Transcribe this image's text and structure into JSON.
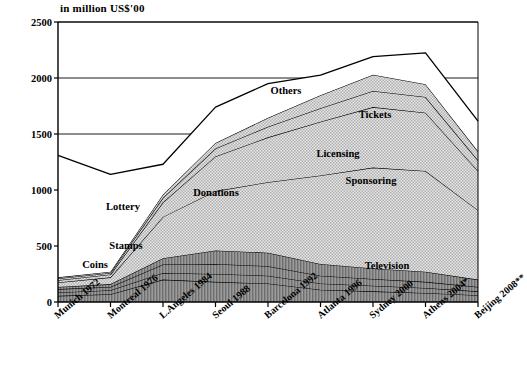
{
  "chart_data": {
    "type": "area",
    "title": "",
    "subtitle": "",
    "ylabel": "in million US$'00",
    "xlabel": "",
    "ylim": [
      0,
      2500
    ],
    "yticks": [
      0,
      500,
      1000,
      1500,
      2000,
      2500
    ],
    "grid": true,
    "legend_position": "inline-annotations",
    "stacked": true,
    "categories": [
      "Munich 1972",
      "Montreal 1976",
      "L.Angeles 1984",
      "Seoul  1988",
      "Barcelona 1992",
      "Atlanta 1996",
      "Sydney 2000",
      "Athens 2004*",
      "Beijing 2008**"
    ],
    "series": [
      {
        "name": "Coins",
        "values": [
          55,
          70,
          200,
          180,
          165,
          110,
          95,
          80,
          60
        ]
      },
      {
        "name": "Stamps",
        "values": [
          30,
          35,
          60,
          70,
          70,
          55,
          50,
          45,
          35
        ]
      },
      {
        "name": "Lottery",
        "values": [
          30,
          30,
          75,
          90,
          85,
          70,
          60,
          55,
          40
        ]
      },
      {
        "name": "Donations",
        "values": [
          20,
          25,
          55,
          120,
          120,
          105,
          95,
          90,
          65
        ]
      },
      {
        "name": "Television",
        "values": [
          40,
          60,
          370,
          530,
          630,
          790,
          900,
          900,
          620
        ]
      },
      {
        "name": "Sponsoring",
        "values": [
          20,
          25,
          130,
          310,
          400,
          480,
          540,
          520,
          350
        ]
      },
      {
        "name": "Licensing",
        "values": [
          15,
          15,
          40,
          70,
          95,
          120,
          145,
          140,
          95
        ]
      },
      {
        "name": "Tickets",
        "values": [
          10,
          10,
          30,
          50,
          80,
          115,
          145,
          115,
          80
        ]
      },
      {
        "name": "Others",
        "values": [
          1090,
          870,
          270,
          320,
          305,
          180,
          160,
          280,
          270
        ]
      }
    ],
    "annotations": [
      {
        "label": "Coins",
        "x": 95,
        "y": 264
      },
      {
        "label": "Stamps",
        "x": 126,
        "y": 245
      },
      {
        "label": "Lottery",
        "x": 123,
        "y": 206
      },
      {
        "label": "Donations",
        "x": 216,
        "y": 192
      },
      {
        "label": "Television",
        "x": 387,
        "y": 265
      },
      {
        "label": "Sponsoring",
        "x": 371,
        "y": 180
      },
      {
        "label": "Licensing",
        "x": 338,
        "y": 153
      },
      {
        "label": "Tickets",
        "x": 375,
        "y": 114
      },
      {
        "label": "Others",
        "x": 286,
        "y": 90
      }
    ]
  }
}
